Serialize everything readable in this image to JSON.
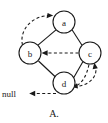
{
  "figure": {
    "caption": "A.",
    "null_label": "null",
    "background_color": "#ffffff",
    "ink_color": "#1a1a1a"
  },
  "diagram": {
    "type": "directed-graph",
    "nodes": [
      {
        "id": "a",
        "label": "a",
        "cx": 64,
        "cy": 22,
        "r": 11
      },
      {
        "id": "b",
        "label": "b",
        "cx": 30,
        "cy": 53,
        "r": 11
      },
      {
        "id": "c",
        "label": "c",
        "cx": 90,
        "cy": 53,
        "r": 11
      },
      {
        "id": "d",
        "label": "d",
        "cx": 64,
        "cy": 83,
        "r": 11
      }
    ],
    "solid_edges": [
      {
        "from": "a",
        "to": "b"
      },
      {
        "from": "a",
        "to": "c"
      },
      {
        "from": "b",
        "to": "d"
      },
      {
        "from": "c",
        "to": "d"
      }
    ],
    "dashed_edges": [
      {
        "from": "b",
        "to": "a",
        "style": "curved",
        "arrow": "at-a"
      },
      {
        "from": "c",
        "to": "b",
        "style": "straight",
        "arrow": "at-b"
      },
      {
        "from": "d",
        "to": "c",
        "style": "curved",
        "arrow": "at-c"
      },
      {
        "from": "c",
        "to": "d",
        "style": "curved",
        "arrow": "at-d"
      },
      {
        "from": "d",
        "to": "null",
        "style": "straight",
        "arrow": "at-null"
      }
    ]
  }
}
